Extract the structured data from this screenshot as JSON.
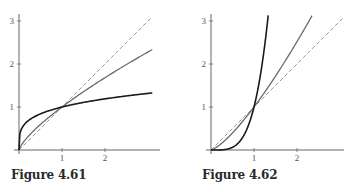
{
  "chart_data": [
    {
      "type": "line",
      "title": "Figure 4.61",
      "xlabel": "",
      "ylabel": "",
      "xlim": [
        0,
        3.1
      ],
      "ylim": [
        0,
        3.2
      ],
      "x_ticks": [
        "1",
        "2"
      ],
      "y_ticks": [
        "1",
        "2",
        "3"
      ],
      "grid": false,
      "series": [
        {
          "name": "y = x^(1/4)",
          "style": "solid-black",
          "color": "#1a1a1a",
          "exponent": 0.25,
          "x_max": 3.1,
          "points": [
            [
              0,
              0
            ],
            [
              0.1,
              0.56
            ],
            [
              0.5,
              0.84
            ],
            [
              1,
              1
            ],
            [
              2,
              1.19
            ],
            [
              3,
              1.32
            ]
          ]
        },
        {
          "name": "y = x^(3/4)",
          "style": "solid-gray",
          "color": "#6a6a6a",
          "exponent": 0.75,
          "x_max": 3.1,
          "points": [
            [
              0,
              0
            ],
            [
              0.5,
              0.59
            ],
            [
              1,
              1
            ],
            [
              2,
              1.68
            ],
            [
              3,
              2.28
            ]
          ]
        },
        {
          "name": "y = x",
          "style": "dashed-gray",
          "color": "#777777",
          "exponent": 1,
          "x_max": 3.1,
          "points": [
            [
              0,
              0
            ],
            [
              1,
              1
            ],
            [
              2,
              2
            ],
            [
              3,
              3
            ]
          ]
        }
      ]
    },
    {
      "type": "line",
      "title": "Figure 4.62",
      "xlabel": "",
      "ylabel": "",
      "xlim": [
        0,
        3.1
      ],
      "ylim": [
        0,
        3.2
      ],
      "x_ticks": [
        "1",
        "2"
      ],
      "y_ticks": [
        "1",
        "2",
        "3"
      ],
      "grid": false,
      "series": [
        {
          "name": "y = x^4",
          "style": "solid-black",
          "color": "#1a1a1a",
          "exponent": 4,
          "x_max": 1.33,
          "points": [
            [
              0,
              0
            ],
            [
              0.5,
              0.06
            ],
            [
              1,
              1
            ],
            [
              1.2,
              2.07
            ],
            [
              1.33,
              3.13
            ]
          ]
        },
        {
          "name": "y = x^(4/3)",
          "style": "solid-gray",
          "color": "#6a6a6a",
          "exponent": 1.3333,
          "x_max": 2.35,
          "points": [
            [
              0,
              0
            ],
            [
              0.5,
              0.4
            ],
            [
              1,
              1
            ],
            [
              2,
              2.52
            ],
            [
              2.35,
              3.13
            ]
          ]
        },
        {
          "name": "y = x",
          "style": "dashed-gray",
          "color": "#777777",
          "exponent": 1,
          "x_max": 3.1,
          "points": [
            [
              0,
              0
            ],
            [
              1,
              1
            ],
            [
              2,
              2
            ],
            [
              3,
              3
            ]
          ]
        }
      ]
    }
  ],
  "captions": {
    "fig1": "Figure 4.61",
    "fig2": "Figure 4.62"
  }
}
